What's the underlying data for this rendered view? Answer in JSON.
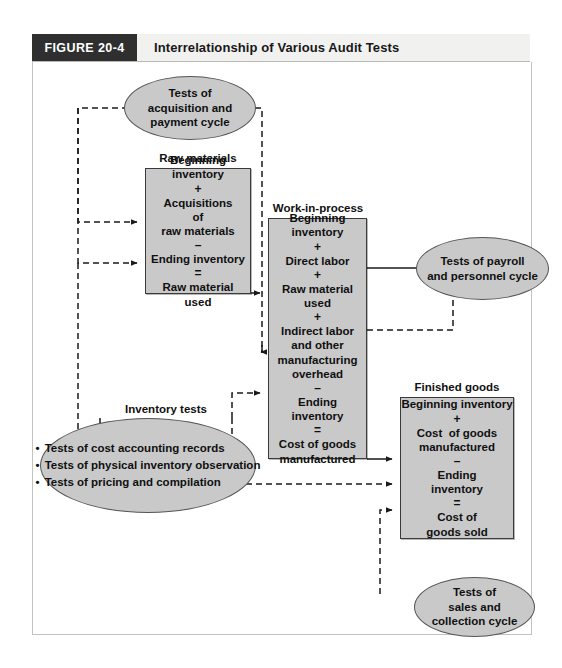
{
  "figure": {
    "tag": "FIGURE 20-4",
    "title": "Interrelationship of Various Audit Tests"
  },
  "captions": {
    "raw_materials": "Raw materials",
    "work_in_process": "Work-in-process",
    "finished_goods": "Finished goods",
    "inventory_tests": "Inventory tests"
  },
  "boxes": {
    "raw_materials": {
      "lines": [
        "Beginning",
        "inventory",
        "+",
        "Acquisitions",
        "of",
        "raw materials",
        "–",
        "Ending inventory",
        "=",
        "Raw material",
        "used"
      ]
    },
    "work_in_process": {
      "lines": [
        "Beginning",
        "inventory",
        "+",
        "Direct labor",
        "+",
        "Raw material",
        "used",
        "+",
        "Indirect labor",
        "and other",
        "manufacturing",
        "overhead",
        "–",
        "Ending",
        "inventory",
        "=",
        "Cost of goods",
        "manufactured"
      ]
    },
    "finished_goods": {
      "lines": [
        "Beginning inventory",
        "+",
        "Cost  of goods",
        "manufactured",
        "–",
        "Ending",
        "inventory",
        "=",
        "Cost of",
        "goods sold"
      ]
    }
  },
  "ovals": {
    "acquisition": {
      "lines": [
        "Tests of",
        "acquisition and",
        "payment cycle"
      ]
    },
    "payroll": {
      "lines": [
        "Tests of payroll",
        "and personnel cycle"
      ]
    },
    "sales": {
      "lines": [
        "Tests of",
        "sales and",
        "collection cycle"
      ]
    },
    "inventory_tests": {
      "bullets": [
        "Tests of cost accounting records",
        "Tests of physical inventory observation",
        "Tests of pricing and compilation"
      ]
    }
  },
  "colors": {
    "tag_background": "#2f2f2f",
    "header_background": "#f1f1ef",
    "node_fill": "#c9c9c9",
    "node_stroke": "#3a3a3a",
    "frame_stroke": "#c2c2be",
    "wire": "#1a1a1a"
  }
}
